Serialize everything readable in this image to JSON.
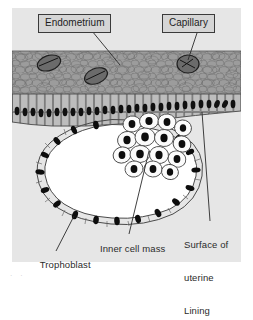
{
  "figure": {
    "type": "biology-diagram",
    "panel": {
      "background_color": "#e6e6e6",
      "endometrium_color": "#9a9a9a",
      "epithelium_color": "#b0b0b0",
      "blastocoel_color": "#ffffff",
      "nucleus_color": "#111111",
      "outline_color": "#3a3a3a"
    },
    "callouts": [
      {
        "id": "endometrium",
        "label": "Endometrium"
      },
      {
        "id": "capillary",
        "label": "Capillary"
      }
    ],
    "labels": [
      {
        "id": "trophoblast",
        "text": "Trophoblast"
      },
      {
        "id": "inner-cell-mass",
        "text": "Inner cell mass"
      },
      {
        "id": "surface-uterine-lining",
        "line1": "Surface of",
        "line2": "uterine",
        "line3": "Lining"
      }
    ],
    "structures": {
      "endometrium": "Endometrium",
      "capillary": "Capillary",
      "epithelium": "Columnar epithelium",
      "trophoblast": "Trophoblast",
      "inner_cell_mass": "Inner cell mass",
      "blastocoel": "Blastocoel cavity"
    },
    "artifact_text": "· ·"
  }
}
